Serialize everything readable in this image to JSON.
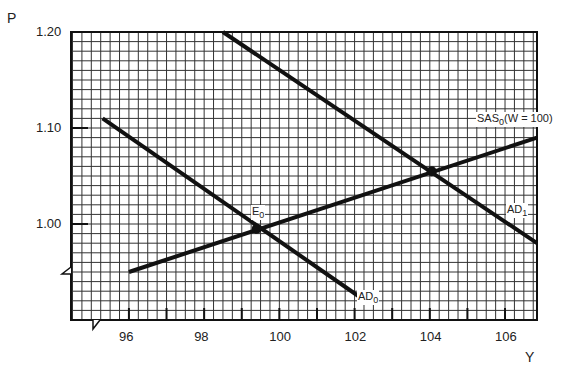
{
  "chart_data": {
    "type": "line",
    "title": "",
    "xlabel": "Y",
    "ylabel": "P",
    "xlim": [
      94.46,
      106.85
    ],
    "ylim": [
      0.9,
      1.2
    ],
    "grid": true,
    "x_ticks": [
      96,
      98,
      100,
      102,
      104,
      106
    ],
    "x_tick_labels": [
      "96",
      "98",
      "100",
      "102",
      "104",
      "106"
    ],
    "y_ticks": [
      1.0,
      1.1,
      1.2
    ],
    "y_tick_labels": [
      "1.00",
      "1.10",
      "1.20"
    ],
    "series": [
      {
        "name": "AD0",
        "label": "AD",
        "sub": "0",
        "points": [
          [
            95.3,
            1.11
          ],
          [
            102.1,
            0.925
          ]
        ]
      },
      {
        "name": "AD1",
        "label": "AD",
        "sub": "1",
        "points": [
          [
            98.5,
            1.2
          ],
          [
            106.85,
            0.98
          ]
        ]
      },
      {
        "name": "SAS0(W = 100)",
        "label": "SAS",
        "sub": "0",
        "suffix": "(W = 100)",
        "points": [
          [
            96.0,
            0.95
          ],
          [
            106.85,
            1.09
          ]
        ]
      }
    ],
    "annotations": [
      {
        "label": "E",
        "sub": "0",
        "point": [
          99.4,
          0.995
        ]
      },
      {
        "label": "",
        "point": [
          104.05,
          1.055
        ]
      }
    ],
    "axis_breaks": [
      "x",
      "y"
    ]
  }
}
